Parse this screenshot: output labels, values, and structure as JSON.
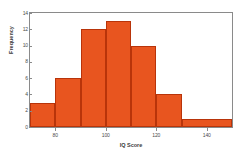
{
  "chart_data": {
    "type": "bar",
    "title": "",
    "subtitle": "",
    "xlabel": "IQ Score",
    "ylabel": "Frequency",
    "categories": [
      "70-80",
      "80-90",
      "90-100",
      "100-110",
      "110-120",
      "120-130",
      "130-150"
    ],
    "bin_edges": [
      70,
      80,
      90,
      100,
      110,
      120,
      130,
      150
    ],
    "values": [
      3,
      6,
      12,
      13,
      10,
      4,
      1
    ],
    "xlim": [
      70,
      150
    ],
    "ylim": [
      0,
      14
    ],
    "xticks": [
      80,
      100,
      120,
      140
    ],
    "xtick_labels": [
      "80",
      "100",
      "120",
      "140"
    ],
    "yticks": [
      0,
      2,
      4,
      6,
      8,
      10,
      12,
      14
    ],
    "ytick_labels": [
      "0",
      "2",
      "4",
      "6",
      "8",
      "10",
      "12",
      "14"
    ],
    "grid": false,
    "legend": false,
    "legend_position": "none",
    "bar_color": "#e8551f",
    "bar_edge_color": "#b8340a",
    "frame_color": "#8a8a8a",
    "background_color": "#ffffff"
  },
  "axes": {
    "x_title": "IQ Score",
    "y_title": "Frequency"
  }
}
